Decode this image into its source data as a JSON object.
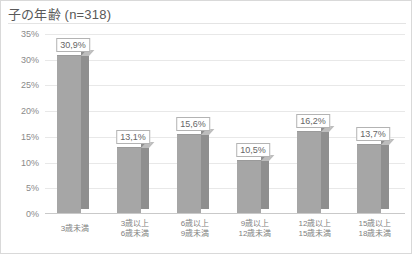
{
  "chart_title": "子の年齢 (n=318)",
  "chart_data": {
    "type": "bar",
    "title": "子の年齢 (n=318)",
    "subtitle": "",
    "xlabel": "",
    "ylabel": "",
    "ylim": [
      0,
      35
    ],
    "grid": true,
    "legend": "none",
    "sample_size": 318,
    "categories": [
      "3歳未満",
      "3歳以上\n6歳未満",
      "6歳以上\n9歳未満",
      "9歳以上\n12歳未満",
      "12歳以上\n15歳未満",
      "15歳以上\n18歳未満"
    ],
    "category_lines": [
      [
        "3歳未満",
        ""
      ],
      [
        "3歳以上",
        "6歳未満"
      ],
      [
        "6歳以上",
        "9歳未満"
      ],
      [
        "9歳以上",
        "12歳未満"
      ],
      [
        "12歳以上",
        "15歳未満"
      ],
      [
        "15歳以上",
        "18歳未満"
      ]
    ],
    "values": [
      30.9,
      13.1,
      15.6,
      10.5,
      16.2,
      13.7
    ],
    "data_labels": [
      "30,9%",
      "13,1%",
      "15,6%",
      "10,5%",
      "16,2%",
      "13,7%"
    ],
    "ytick_values": [
      0,
      5,
      10,
      15,
      20,
      25,
      30,
      35
    ],
    "ytick_labels": [
      "0%",
      "5%",
      "10%",
      "15%",
      "20%",
      "25%",
      "30%",
      "35%"
    ],
    "bar_color": "#a6a6a6",
    "bar_side_color": "#8f8f8f",
    "bar_top_color": "#bdbdbd",
    "gridline_color": "#e8e8e8",
    "text_color": "#7f7f7f",
    "title_color": "#595959"
  }
}
